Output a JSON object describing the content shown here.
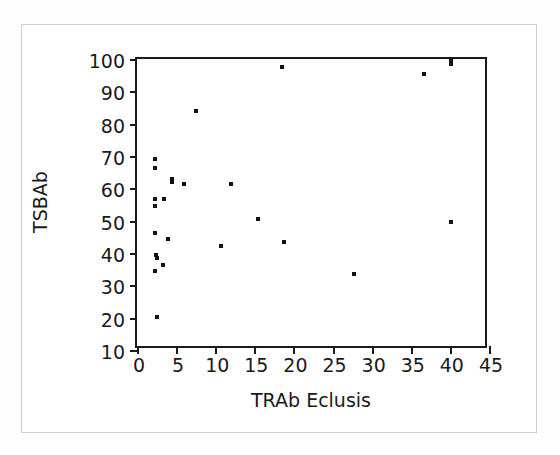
{
  "chart_data": {
    "type": "scatter",
    "title": "",
    "xlabel": "TRAb Eclusis",
    "ylabel": "TSBAb",
    "xlim": [
      0,
      45
    ],
    "ylim": [
      10,
      100
    ],
    "xticks": [
      0,
      5,
      10,
      15,
      20,
      25,
      30,
      35,
      40,
      45
    ],
    "xtick_labels": [
      "0",
      "5",
      "10",
      "15",
      "20",
      "25",
      "30",
      "35",
      "40",
      "45"
    ],
    "yticks": [
      10,
      20,
      30,
      40,
      50,
      60,
      70,
      80,
      90,
      100
    ],
    "ytick_labels": [
      "10",
      "20",
      "30",
      "40",
      "50",
      "60",
      "70",
      "80",
      "90",
      "100"
    ],
    "grid": false,
    "legend": null,
    "marker_color": "#111111",
    "axis_color": "#1a1a1a",
    "points": [
      {
        "x": 2.3,
        "y": 69.2
      },
      {
        "x": 2.3,
        "y": 66.3
      },
      {
        "x": 4.5,
        "y": 63.0
      },
      {
        "x": 4.5,
        "y": 62.0
      },
      {
        "x": 6.0,
        "y": 61.4
      },
      {
        "x": 12.0,
        "y": 61.4
      },
      {
        "x": 7.5,
        "y": 84.0
      },
      {
        "x": 2.3,
        "y": 56.6
      },
      {
        "x": 3.5,
        "y": 56.6
      },
      {
        "x": 2.3,
        "y": 54.6
      },
      {
        "x": 2.3,
        "y": 46.3
      },
      {
        "x": 4.0,
        "y": 44.2
      },
      {
        "x": 2.4,
        "y": 39.4
      },
      {
        "x": 2.5,
        "y": 38.3
      },
      {
        "x": 3.3,
        "y": 36.4
      },
      {
        "x": 2.3,
        "y": 34.3
      },
      {
        "x": 2.5,
        "y": 20.3
      },
      {
        "x": 10.8,
        "y": 42.3
      },
      {
        "x": 15.5,
        "y": 50.5
      },
      {
        "x": 18.5,
        "y": 97.5
      },
      {
        "x": 18.8,
        "y": 43.3
      },
      {
        "x": 27.8,
        "y": 33.4
      },
      {
        "x": 36.7,
        "y": 95.4
      },
      {
        "x": 40.1,
        "y": 99.8
      },
      {
        "x": 40.1,
        "y": 98.6
      },
      {
        "x": 40.1,
        "y": 49.5
      }
    ]
  }
}
